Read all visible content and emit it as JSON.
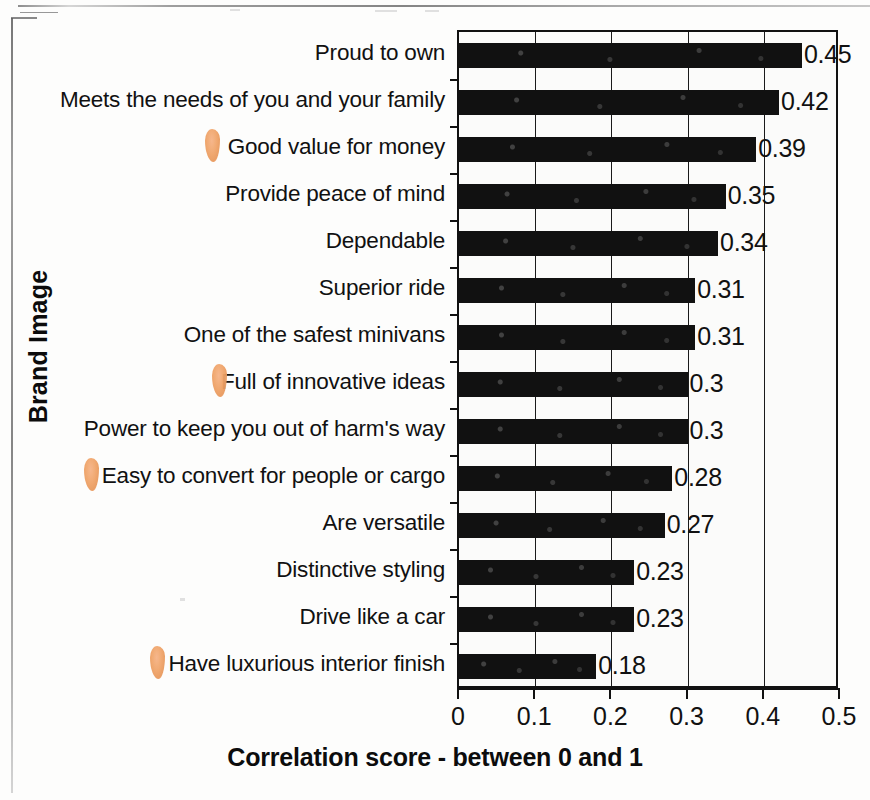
{
  "chart_data": {
    "type": "bar",
    "orientation": "horizontal",
    "title": "",
    "xlabel": "Correlation score - between 0 and 1",
    "ylabel": "Brand Image",
    "xlim": [
      0,
      0.5
    ],
    "xticks": [
      "0",
      "0.1",
      "0.2",
      "0.3",
      "0.4",
      "0.5"
    ],
    "xtick_values": [
      0,
      0.1,
      0.2,
      0.3,
      0.4,
      0.5
    ],
    "grid": true,
    "legend": "none",
    "bar_color": "#111111",
    "categories": [
      "Proud to own",
      "Meets the needs of you and your family",
      "Good value for money",
      "Provide peace of mind",
      "Dependable",
      "Superior ride",
      "One of the safest minivans",
      "Full of innovative ideas",
      "Power to keep you out of harm's way",
      "Easy to convert for people or cargo",
      "Are versatile",
      "Distinctive styling",
      "Drive like a car",
      "Have luxurious interior finish"
    ],
    "values": [
      0.45,
      0.42,
      0.39,
      0.35,
      0.34,
      0.31,
      0.31,
      0.3,
      0.3,
      0.28,
      0.27,
      0.23,
      0.23,
      0.18
    ],
    "value_labels": [
      "0.45",
      "0.42",
      "0.39",
      "0.35",
      "0.34",
      "0.31",
      "0.31",
      "0.3",
      "0.3",
      "0.28",
      "0.27",
      "0.23",
      "0.23",
      "0.18"
    ]
  },
  "annotations": {
    "color": "#f0a469",
    "marks": [
      {
        "category": "Good value for money",
        "row": 2
      },
      {
        "category": "Full of innovative ideas",
        "row": 7
      },
      {
        "category": "Easy to convert for people or cargo",
        "row": 9
      },
      {
        "category": "Have luxurious interior finish",
        "row": 13
      }
    ]
  }
}
